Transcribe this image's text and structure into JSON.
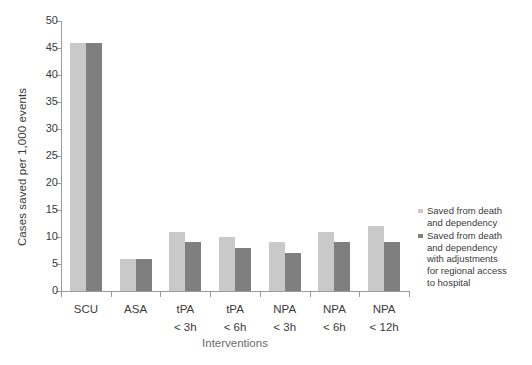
{
  "chart_data": {
    "type": "bar",
    "title": "",
    "xlabel": "Interventions",
    "ylabel": "Cases saved per 1,000 events",
    "ylim": [
      0,
      50
    ],
    "yticks": [
      0,
      5,
      10,
      15,
      20,
      25,
      30,
      35,
      40,
      45,
      50
    ],
    "ytick_labels": [
      "0",
      "5",
      "10",
      "15",
      "20",
      "25",
      "30",
      "35",
      "40",
      "45",
      "50"
    ],
    "grid": false,
    "legend_position": "right",
    "categories": [
      "SCU",
      "ASA",
      "tPA < 3h",
      "tPA < 6h",
      "NPA < 3h",
      "NPA < 6h",
      "NPA < 12h"
    ],
    "category_lines": [
      {
        "line1": "SCU",
        "line2": ""
      },
      {
        "line1": "ASA",
        "line2": ""
      },
      {
        "line1": "tPA",
        "line2": "< 3h"
      },
      {
        "line1": "tPA",
        "line2": "< 6h"
      },
      {
        "line1": "NPA",
        "line2": "< 3h"
      },
      {
        "line1": "NPA",
        "line2": "< 6h"
      },
      {
        "line1": "NPA",
        "line2": "< 12h"
      }
    ],
    "series": [
      {
        "name": "Saved from death and dependency",
        "color": "#c9c9c9",
        "values": [
          46,
          6,
          11,
          10,
          9,
          11,
          12
        ]
      },
      {
        "name": "Saved from death and dependency with adjustments for regional access to hospital",
        "color": "#7f7f7f",
        "values": [
          46,
          6,
          9,
          8,
          7,
          9,
          9
        ]
      }
    ]
  },
  "legend": {
    "entries": [
      {
        "swatch_color": "#c9c9c9",
        "lines": [
          "Saved from death",
          "and dependency"
        ]
      },
      {
        "swatch_color": "#7f7f7f",
        "lines": [
          "Saved from death",
          "and dependency",
          "with adjustments",
          "for regional access",
          "to hospital"
        ]
      }
    ]
  }
}
